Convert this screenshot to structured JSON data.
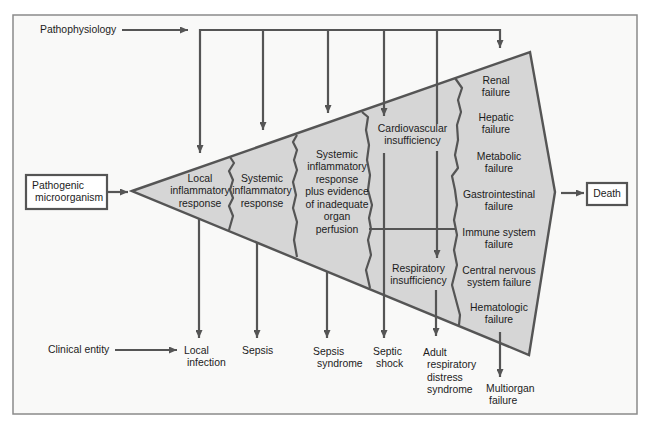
{
  "diagram": {
    "row_labels": {
      "pathophysiology": "Pathophysiology",
      "clinical_entity": "Clinical entity"
    },
    "source": {
      "lines": [
        "Pathogenic",
        "microorganism"
      ]
    },
    "outcome": {
      "label": "Death"
    },
    "stages": [
      {
        "lines": [
          "Local",
          "inflammatory",
          "response"
        ]
      },
      {
        "lines": [
          "Systemic",
          "inflammatory",
          "response"
        ]
      },
      {
        "lines": [
          "Systemic",
          "inflammatory",
          "response",
          "plus evidence",
          "of inadequate",
          "organ",
          "perfusion"
        ]
      },
      {
        "lines": [
          "Cardiovascular",
          "insufficiency"
        ]
      },
      {
        "lines": [
          "Respiratory",
          "insufficiency"
        ]
      }
    ],
    "organ_failures": [
      {
        "lines": [
          "Renal",
          "failure"
        ]
      },
      {
        "lines": [
          "Hepatic",
          "failure"
        ]
      },
      {
        "lines": [
          "Metabolic",
          "failure"
        ]
      },
      {
        "lines": [
          "Gastrointestinal",
          "failure"
        ]
      },
      {
        "lines": [
          "Immune system",
          "failure"
        ]
      },
      {
        "lines": [
          "Central nervous",
          "system failure"
        ]
      },
      {
        "lines": [
          "Hematologic",
          "failure"
        ]
      }
    ],
    "clinical_entities": [
      {
        "lines": [
          "Local",
          "infection"
        ]
      },
      {
        "lines": [
          "Sepsis"
        ]
      },
      {
        "lines": [
          "Sepsis",
          "syndrome"
        ]
      },
      {
        "lines": [
          "Septic",
          "shock"
        ]
      },
      {
        "lines": [
          "Adult",
          "respiratory",
          "distress",
          "syndrome"
        ]
      },
      {
        "lines": [
          "Multiorgan",
          "failure"
        ]
      }
    ],
    "edges": [
      {
        "from": "Pathogenic microorganism",
        "to": "Local inflammatory response"
      },
      {
        "from": "Organ failures",
        "to": "Death"
      },
      {
        "from": "Pathophysiology",
        "to": "Local inflammatory response"
      },
      {
        "from": "Pathophysiology",
        "to": "Systemic inflammatory response"
      },
      {
        "from": "Pathophysiology",
        "to": "Systemic inflammatory response plus evidence of inadequate organ perfusion"
      },
      {
        "from": "Pathophysiology",
        "to": "Cardiovascular insufficiency"
      },
      {
        "from": "Pathophysiology",
        "to": "Respiratory insufficiency"
      },
      {
        "from": "Pathophysiology",
        "to": "Organ failures"
      },
      {
        "from": "Local inflammatory response",
        "to": "Local infection"
      },
      {
        "from": "Systemic inflammatory response",
        "to": "Sepsis"
      },
      {
        "from": "Systemic inflammatory response plus evidence of inadequate organ perfusion",
        "to": "Sepsis syndrome"
      },
      {
        "from": "Cardiovascular insufficiency",
        "to": "Septic shock"
      },
      {
        "from": "Respiratory insufficiency",
        "to": "Adult respiratory distress syndrome"
      },
      {
        "from": "Hematologic failure",
        "to": "Multiorgan failure"
      },
      {
        "from": "Clinical entity",
        "to": "Local infection"
      }
    ]
  },
  "colors": {
    "frame_border": "#8a8a8a",
    "frame_background": "#f9f9f8",
    "shape_fill": "#d6d6d6",
    "line": "#555555",
    "text": "#1c1c1c",
    "box_fill": "#ffffff"
  }
}
